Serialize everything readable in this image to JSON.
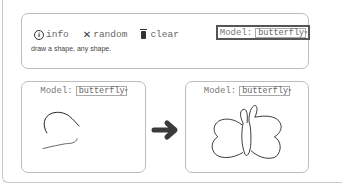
{
  "toolbar": {
    "info_label": "info",
    "random_label": "random",
    "clear_label": "clear",
    "icons": {
      "info": "info-circle-icon",
      "random": "shuffle-x-icon",
      "clear": "trash-icon"
    }
  },
  "hint_text": "draw a shape, any shape.",
  "top_model": {
    "label": "Model:",
    "selected": "butterfly"
  },
  "left_panel": {
    "model_label": "Model:",
    "selected": "butterfly",
    "content": "user sketch (partial strokes)"
  },
  "right_panel": {
    "model_label": "Model:",
    "selected": "butterfly",
    "content": "generated butterfly sketch"
  },
  "arrow_icon": "right-arrow-icon",
  "colors": {
    "stroke": "#222222",
    "border": "#bdbdbd",
    "arrow": "#3a3a3a"
  }
}
